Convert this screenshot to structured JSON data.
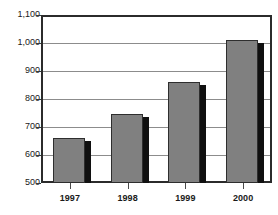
{
  "chart_data": {
    "type": "bar",
    "title": "",
    "subtitle": "",
    "xlabel": "",
    "ylabel": "",
    "categories": [
      "1997",
      "1998",
      "1999",
      "2000"
    ],
    "values": [
      660,
      745,
      862,
      1010
    ],
    "series": [
      {
        "name": "",
        "values": [
          660,
          745,
          862,
          1010
        ]
      }
    ],
    "ylim": [
      500,
      1100
    ],
    "ytick_values": [
      1100,
      1000,
      900,
      800,
      700,
      600,
      500
    ],
    "ytick_labels": [
      "1,100",
      "1,000",
      "900",
      "800",
      "700",
      "600",
      "500"
    ],
    "xtick_labels": [
      "1997",
      "1998",
      "1999",
      "2000"
    ],
    "grid": true,
    "grid_axis": "y",
    "legend": false,
    "legend_position": "none",
    "annotations": [],
    "colors": {
      "bar_fill": "#808080",
      "bar_edge": "#2e2e2e",
      "bar_shadow": "#101010",
      "gridline": "#8c8c8c",
      "frame": "#2b2b2b",
      "text": "#1a1a1a",
      "background": "#ffffff"
    }
  }
}
